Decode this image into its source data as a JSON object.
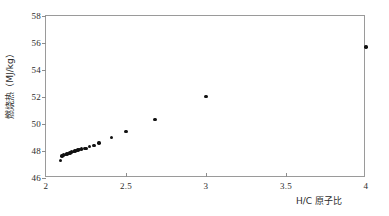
{
  "chart_data": {
    "type": "scatter",
    "title": "",
    "xlabel": "H/C 原子比",
    "ylabel": "燃烧热（MJ/kg）",
    "xlim": [
      2,
      4
    ],
    "ylim": [
      46,
      58
    ],
    "xticks": [
      "2",
      "2.5",
      "3",
      "3.5",
      "4"
    ],
    "xtick_values": [
      2,
      2.5,
      3,
      3.5,
      4
    ],
    "yticks": [
      "46",
      "48",
      "50",
      "52",
      "54",
      "56",
      "58"
    ],
    "ytick_values": [
      46,
      48,
      50,
      52,
      54,
      56,
      58
    ],
    "grid": false,
    "legend": null,
    "marker": "filled-circle",
    "marker_color": "#111111",
    "points": [
      {
        "x": 2.09,
        "y": 47.28
      },
      {
        "x": 2.1,
        "y": 47.62
      },
      {
        "x": 2.11,
        "y": 47.7
      },
      {
        "x": 2.12,
        "y": 47.74
      },
      {
        "x": 2.13,
        "y": 47.78
      },
      {
        "x": 2.14,
        "y": 47.82
      },
      {
        "x": 2.15,
        "y": 47.86
      },
      {
        "x": 2.16,
        "y": 47.92
      },
      {
        "x": 2.17,
        "y": 47.96
      },
      {
        "x": 2.18,
        "y": 48.0
      },
      {
        "x": 2.19,
        "y": 48.04
      },
      {
        "x": 2.2,
        "y": 48.08
      },
      {
        "x": 2.21,
        "y": 48.12
      },
      {
        "x": 2.22,
        "y": 48.14
      },
      {
        "x": 2.24,
        "y": 48.18
      },
      {
        "x": 2.25,
        "y": 48.2
      },
      {
        "x": 2.27,
        "y": 48.32
      },
      {
        "x": 2.3,
        "y": 48.42
      },
      {
        "x": 2.33,
        "y": 48.58
      },
      {
        "x": 2.41,
        "y": 49.0
      },
      {
        "x": 2.5,
        "y": 49.45
      },
      {
        "x": 2.68,
        "y": 50.33
      },
      {
        "x": 3.0,
        "y": 52.05
      },
      {
        "x": 4.0,
        "y": 55.7
      }
    ]
  }
}
